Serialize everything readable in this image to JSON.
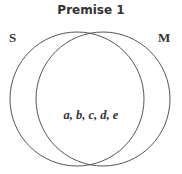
{
  "title": "Premise 1",
  "sets": [
    {
      "label": "S",
      "cx": 77,
      "cy": 99,
      "r": 67
    },
    {
      "label": "M",
      "cx": 103,
      "cy": 99,
      "r": 67
    }
  ],
  "intersection_members": "a, b, c, d, e",
  "colors": {
    "stroke": "#555555",
    "text": "#333333"
  }
}
